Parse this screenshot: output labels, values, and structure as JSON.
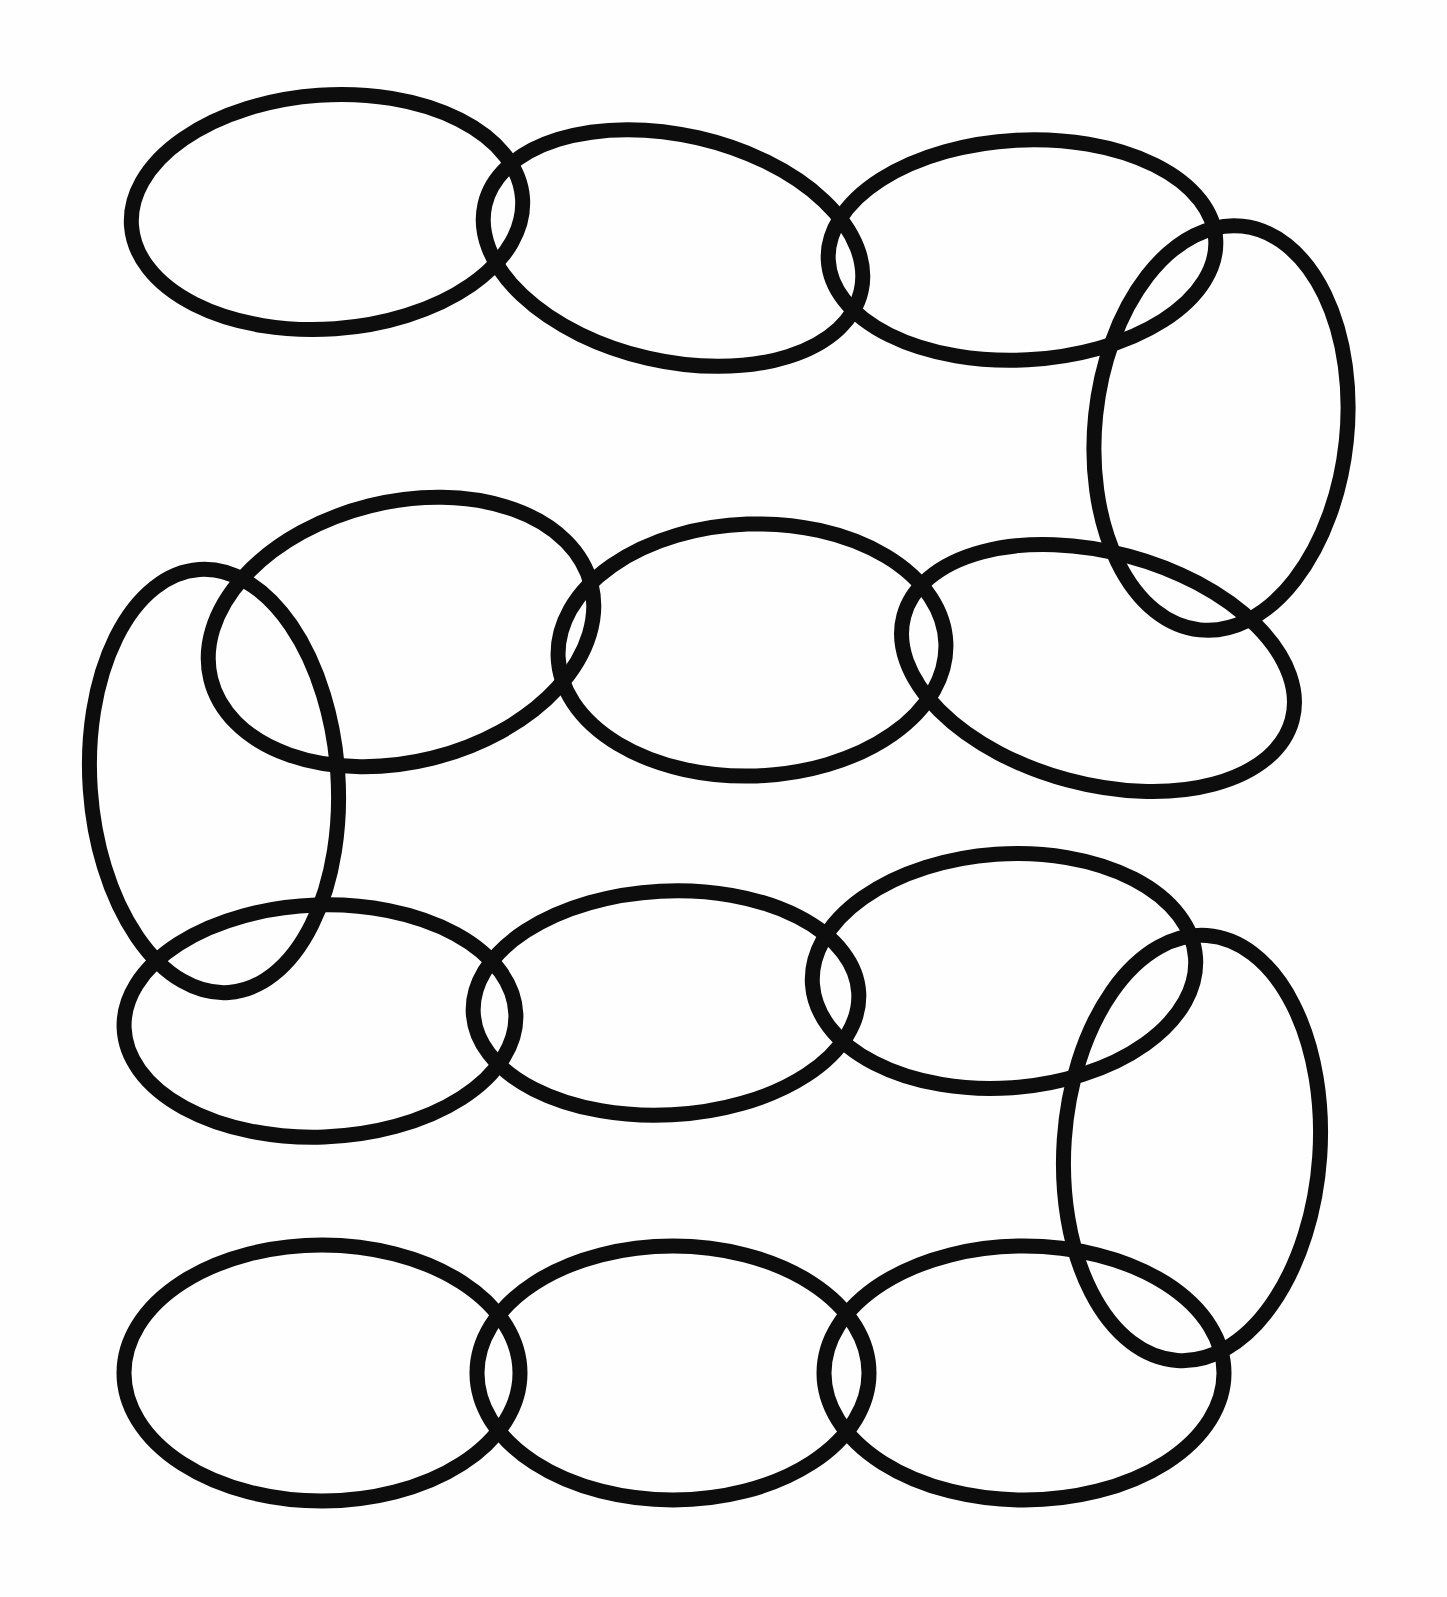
{
  "artwork": {
    "title": "Serpentine Chain of Interlocking Ellipses",
    "description": "A hand-drawn boustrophedon chain of thick black outlined ellipses on white paper. Four horizontal rows of ellipses are joined at the right end of row 1, the right end of row 3 and the left end of row 2 by tall vertical ellipses that turn the chain back on itself.",
    "canvas": {
      "width": 1447,
      "height": 1597,
      "background_color": "#fefefe"
    },
    "stroke": {
      "color": "#0d0d0d",
      "width": 15
    },
    "link_count": 14,
    "row_count": 4
  },
  "chart_data": {
    "type": "diagram",
    "xlabel": "",
    "ylabel": "",
    "xlim": [
      0,
      1447
    ],
    "ylim": [
      0,
      1597
    ],
    "grid": false,
    "legend": "none",
    "shape": "ellipse",
    "stroke_color": "#0d0d0d",
    "stroke_width": 15,
    "fill": "none",
    "rows": [
      {
        "row": 1,
        "orientation": "horizontal",
        "direction": "left-to-right",
        "link_ids": [
          "r1-e1",
          "r1-e2",
          "r1-e3"
        ]
      },
      {
        "row": 2,
        "orientation": "horizontal",
        "direction": "right-to-left",
        "link_ids": [
          "r2-e1",
          "r2-e2",
          "r2-e3"
        ]
      },
      {
        "row": 3,
        "orientation": "horizontal",
        "direction": "left-to-right",
        "link_ids": [
          "r3-e1",
          "r3-e2",
          "r3-e3"
        ]
      },
      {
        "row": 4,
        "orientation": "horizontal",
        "direction": "right-to-left",
        "link_ids": [
          "r4-e1",
          "r4-e2",
          "r4-e3"
        ]
      }
    ],
    "links": [
      {
        "id": "r1-e1",
        "row": 1,
        "index": 1,
        "kind": "horizontal",
        "cx": 327,
        "cy": 212,
        "rx": 196,
        "ry": 117,
        "rotation": -4
      },
      {
        "id": "r1-e2",
        "row": 1,
        "index": 2,
        "kind": "horizontal",
        "cx": 673,
        "cy": 248,
        "rx": 193,
        "ry": 113,
        "rotation": 13
      },
      {
        "id": "r1-e3",
        "row": 1,
        "index": 3,
        "kind": "horizontal",
        "cx": 1022,
        "cy": 250,
        "rx": 194,
        "ry": 110,
        "rotation": -3
      },
      {
        "id": "turn-1",
        "row": 1,
        "index": 4,
        "kind": "vertical-turn",
        "cx": 1221,
        "cy": 428,
        "rx": 126,
        "ry": 203,
        "rotation": 6
      },
      {
        "id": "r2-e3",
        "row": 2,
        "index": 3,
        "kind": "horizontal",
        "cx": 1098,
        "cy": 668,
        "rx": 201,
        "ry": 116,
        "rotation": 15
      },
      {
        "id": "r2-e2",
        "row": 2,
        "index": 2,
        "kind": "horizontal",
        "cx": 752,
        "cy": 650,
        "rx": 194,
        "ry": 126,
        "rotation": -2
      },
      {
        "id": "r2-e1",
        "row": 2,
        "index": 1,
        "kind": "horizontal",
        "cx": 401,
        "cy": 632,
        "rx": 196,
        "ry": 130,
        "rotation": -14
      },
      {
        "id": "turn-2",
        "row": 2,
        "index": 0,
        "kind": "vertical-turn",
        "cx": 214,
        "cy": 781,
        "rx": 124,
        "ry": 212,
        "rotation": -4
      },
      {
        "id": "r3-e1",
        "row": 3,
        "index": 1,
        "kind": "horizontal",
        "cx": 320,
        "cy": 1021,
        "rx": 196,
        "ry": 116,
        "rotation": -2
      },
      {
        "id": "r3-e2",
        "row": 3,
        "index": 2,
        "kind": "horizontal",
        "cx": 666,
        "cy": 1003,
        "rx": 193,
        "ry": 112,
        "rotation": -3
      },
      {
        "id": "r3-e3",
        "row": 3,
        "index": 3,
        "kind": "horizontal",
        "cx": 1004,
        "cy": 971,
        "rx": 192,
        "ry": 117,
        "rotation": -4
      },
      {
        "id": "turn-3",
        "row": 3,
        "index": 4,
        "kind": "vertical-turn",
        "cx": 1192,
        "cy": 1148,
        "rx": 128,
        "ry": 213,
        "rotation": 4
      },
      {
        "id": "r4-e3",
        "row": 4,
        "index": 3,
        "kind": "horizontal",
        "cx": 1024,
        "cy": 1373,
        "rx": 200,
        "ry": 127,
        "rotation": 0
      },
      {
        "id": "r4-e2",
        "row": 4,
        "index": 2,
        "kind": "horizontal",
        "cx": 673,
        "cy": 1373,
        "rx": 196,
        "ry": 127,
        "rotation": 0
      },
      {
        "id": "r4-e1",
        "row": 4,
        "index": 1,
        "kind": "horizontal",
        "cx": 322,
        "cy": 1373,
        "rx": 198,
        "ry": 128,
        "rotation": 0
      }
    ]
  }
}
